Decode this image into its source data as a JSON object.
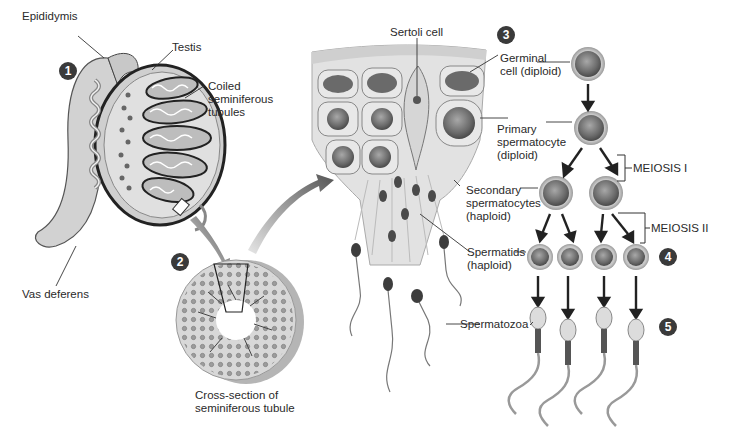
{
  "figure": {
    "steps": [
      {
        "number": "1",
        "label": "Testis overview"
      },
      {
        "number": "2",
        "label": "Cross-section of seminiferous tubule"
      },
      {
        "number": "3",
        "label": "Tubule wall detail"
      },
      {
        "number": "4",
        "label": "Spermatids"
      },
      {
        "number": "5",
        "label": "Spermatozoa"
      }
    ]
  },
  "labels": {
    "epididymis": "Epididymis",
    "testis": "Testis",
    "coiled_tubules": "Coiled\nseminiferous\ntubules",
    "vas_deferens": "Vas deferens",
    "cross_section": "Cross-section of\nseminiferous tubule",
    "sertoli": "Sertoli cell",
    "germinal": "Germinal\ncell (diploid)",
    "primary": "Primary\nspermatocyte\n(diploid)",
    "secondary": "Secondary\nspermatocytes\n(haploid)",
    "spermatids": "Spermatids\n(haploid)",
    "spermatozoa": "Spermatozoa",
    "meiosis1": "MEIOSIS I",
    "meiosis2": "MEIOSIS II"
  },
  "colors": {
    "badge": "#3a3a3a",
    "cell_fill": "#8a8a8a",
    "cell_ring": "#c4c4c4",
    "tissue": "#dcdcdc",
    "line": "#333333"
  }
}
